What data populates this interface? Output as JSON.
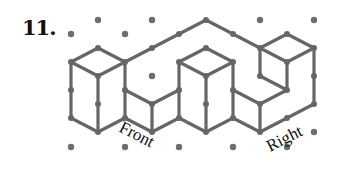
{
  "problem": {
    "number": "11."
  },
  "labels": {
    "front": "Front",
    "right": "Right"
  },
  "colors": {
    "edge": "#666666",
    "dot": "#6e6e6e",
    "text": "#111111"
  },
  "grid": {
    "origin_x": 71,
    "dx": 27,
    "dy": 14
  }
}
